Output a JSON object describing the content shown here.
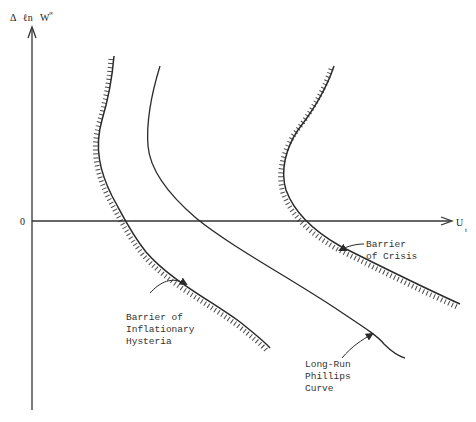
{
  "diagram": {
    "y_axis": {
      "label_parts": [
        "Δ",
        "ℓn",
        "W",
        "∞"
      ],
      "label": "Δ ℓn W^∞"
    },
    "x_axis": {
      "label_main": "U",
      "label_sub": "t",
      "label": "U_t"
    },
    "origin_label": "0",
    "curves": [
      {
        "name": "Barrier of Inflationary Hysteria",
        "style": "hatched"
      },
      {
        "name": "Long-Run Phillips Curve",
        "style": "solid"
      },
      {
        "name": "Barrier of Crisis",
        "style": "hatched"
      }
    ],
    "labels": {
      "hysteria": [
        "Barrier of",
        "Inflationary",
        "Hysteria"
      ],
      "crisis": [
        "Barrier",
        "of Crisis"
      ],
      "phillips": [
        "Long-Run",
        "Phillips",
        "Curve"
      ]
    },
    "colors": {
      "ink": "#2a2a2a",
      "background": "#ffffff"
    }
  }
}
